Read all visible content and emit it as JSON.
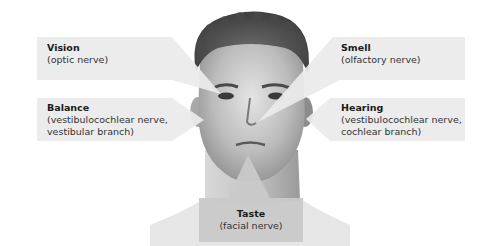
{
  "diagram": {
    "colors": {
      "callout_fill": "#ebebeb",
      "taste_fill": "#c9c9c9",
      "skin_light": "#e6e6e6",
      "skin_mid": "#bdbdbd",
      "hair": "#5a5a5a"
    },
    "callouts": [
      {
        "id": "vision",
        "title": "Vision",
        "lines": [
          "(optic nerve)"
        ],
        "target": "eye"
      },
      {
        "id": "balance",
        "title": "Balance",
        "lines": [
          "(vestibulocochlear nerve,",
          "vestibular branch)"
        ],
        "target": "ear"
      },
      {
        "id": "smell",
        "title": "Smell",
        "lines": [
          "(olfactory nerve)"
        ],
        "target": "nose"
      },
      {
        "id": "hearing",
        "title": "Hearing",
        "lines": [
          "(vestibulocochlear nerve,",
          "cochlear branch)"
        ],
        "target": "ear"
      },
      {
        "id": "taste",
        "title": "Taste",
        "lines": [
          "(facial nerve)"
        ],
        "target": "mouth"
      }
    ]
  }
}
